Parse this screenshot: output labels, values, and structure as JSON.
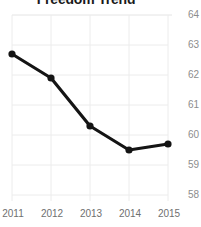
{
  "chart_data": {
    "type": "line",
    "title": "Freedom Trend",
    "xlabel": "",
    "ylabel": "",
    "categories": [
      "2011",
      "2012",
      "2013",
      "2014",
      "2015"
    ],
    "values": [
      62.7,
      61.9,
      60.3,
      59.5,
      59.7
    ],
    "series": [
      {
        "name": "Freedom Score",
        "values": [
          62.7,
          61.9,
          60.3,
          59.5,
          59.7
        ]
      }
    ],
    "x": [
      2011,
      2012,
      2013,
      2014,
      2015
    ],
    "ylim": [
      58,
      64
    ],
    "xlim": [
      2011,
      2015
    ],
    "y_ticks": [
      64,
      63,
      62,
      61,
      60,
      59,
      58
    ],
    "x_ticks": [
      "2011",
      "2012",
      "2013",
      "2014",
      "2015"
    ],
    "grid": true,
    "y_axis_position": "right",
    "legend": false,
    "legend_position": "none",
    "marker": "circle",
    "colors": {
      "line": "#141414",
      "marker": "#141414",
      "grid": "#ececec",
      "background": "#ffffff",
      "y_tick_text": "#8d8d8d",
      "x_tick_text": "#6f6f6f",
      "title_text": "#1a1a1a"
    }
  }
}
